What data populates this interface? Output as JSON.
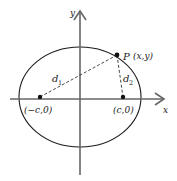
{
  "diagram": {
    "type": "ellipse-foci",
    "axes": {
      "x_label": "x",
      "y_label": "y"
    },
    "point": {
      "name": "P",
      "coords": "(x,y)"
    },
    "foci": [
      {
        "label": "(−c,0)"
      },
      {
        "label": "(c,0)"
      }
    ],
    "distances": [
      {
        "symbol": "d",
        "subscript": "1"
      },
      {
        "symbol": "d",
        "subscript": "2"
      }
    ],
    "colors": {
      "axis": "#666666",
      "ellipse": "#1a1a1a",
      "dashed": "#333333",
      "point": "#111111"
    }
  }
}
